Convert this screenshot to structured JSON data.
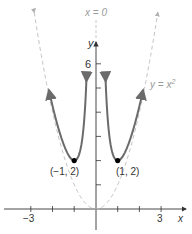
{
  "chart_data": {
    "type": "line",
    "title": "",
    "xlabel": "x",
    "ylabel": "y",
    "xlim": [
      -4,
      4.3
    ],
    "ylim": [
      -1,
      8
    ],
    "x_ticks": [
      -3,
      -2,
      -1,
      1,
      2,
      3
    ],
    "x_tick_labels": [
      "-3",
      "3"
    ],
    "y_ticks": [
      1,
      2,
      3,
      4,
      5,
      6
    ],
    "y_tick_labels": [
      "6"
    ],
    "grid": false,
    "series": [
      {
        "name": "y = x^2 + 1/x^2",
        "style": "solid",
        "color": "#6b6b6b",
        "domain": [
          [
            -2.2,
            -0.36
          ],
          [
            0.36,
            2.2
          ]
        ],
        "arrows": true
      },
      {
        "name": "y = x^2",
        "style": "dashed",
        "color": "#bdbdbd",
        "domain": [
          -2.9,
          2.9
        ],
        "arrows": true
      },
      {
        "name": "x = 0",
        "style": "dashed",
        "color": "#bdbdbd",
        "vertical_asymptote": 0
      }
    ],
    "points": [
      {
        "x": -1,
        "y": 2,
        "label": "(−1, 2)"
      },
      {
        "x": 1,
        "y": 2,
        "label": "(1, 2)"
      }
    ],
    "annotations": [
      "x = 0",
      "y = x²"
    ]
  },
  "labels": {
    "asymptote": "x = 0",
    "parabola": "y = x",
    "parabola_exp": "2",
    "y_axis": "y",
    "x_axis": "x",
    "y_tick_6": "6",
    "x_tick_neg3": "−3",
    "x_tick_3": "3",
    "point_left": "(−1, 2)",
    "point_right": "(1, 2)"
  }
}
